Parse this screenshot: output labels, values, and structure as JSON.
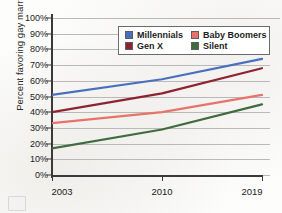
{
  "chart_data": {
    "type": "line",
    "title": "",
    "xlabel": "",
    "ylabel": "Percent favoring gay marriage",
    "x": [
      2003,
      2010,
      2019
    ],
    "x_tick_labels": [
      "2003",
      "2010",
      "2019"
    ],
    "ylim": [
      0,
      100
    ],
    "y_tick_labels": [
      "0%",
      "10%",
      "20%",
      "30%",
      "40%",
      "50%",
      "60%",
      "70%",
      "80%",
      "90%",
      "100%"
    ],
    "y_tick_values": [
      0,
      10,
      20,
      30,
      40,
      50,
      60,
      70,
      80,
      90,
      100
    ],
    "grid": true,
    "legend_position": "top-right-inside",
    "series": [
      {
        "name": "Millennials",
        "color": "#4a6fbe",
        "values": [
          51,
          61,
          74
        ]
      },
      {
        "name": "Baby Boomers",
        "color": "#e8736a",
        "values": [
          33,
          40,
          51
        ]
      },
      {
        "name": "Gen X",
        "color": "#8e2230",
        "values": [
          40,
          52,
          68
        ]
      },
      {
        "name": "Silent",
        "color": "#3f6b3f",
        "values": [
          17,
          29,
          45
        ]
      }
    ]
  },
  "legend": {
    "entries": [
      {
        "label": "Millennials",
        "color": "#4a6fbe"
      },
      {
        "label": "Baby Boomers",
        "color": "#e8736a"
      },
      {
        "label": "Gen X",
        "color": "#8e2230"
      },
      {
        "label": "Silent",
        "color": "#3f6b3f"
      }
    ]
  },
  "axes": {
    "y_title": "Percent favoring gay marriage"
  }
}
